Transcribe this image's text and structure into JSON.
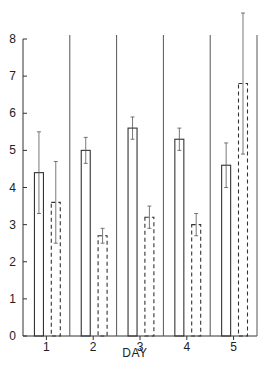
{
  "chart_data": {
    "type": "bar",
    "title": "",
    "xlabel": "DAY",
    "ylabel": "",
    "ylim": [
      0,
      8
    ],
    "yticks": [
      0,
      1,
      2,
      3,
      4,
      5,
      6,
      7,
      8
    ],
    "categories": [
      "1",
      "2",
      "3",
      "4",
      "5"
    ],
    "grid": false,
    "legend": null,
    "series": [
      {
        "name": "solid",
        "style": "solid",
        "values": [
          4.4,
          5.0,
          5.6,
          5.3,
          4.6
        ],
        "errors": [
          1.1,
          0.35,
          0.3,
          0.3,
          0.6
        ]
      },
      {
        "name": "dashed",
        "style": "dashed",
        "values": [
          3.6,
          2.7,
          3.2,
          3.0,
          6.8
        ],
        "errors": [
          1.1,
          0.2,
          0.3,
          0.3,
          1.9
        ]
      }
    ],
    "color": "#333333"
  }
}
